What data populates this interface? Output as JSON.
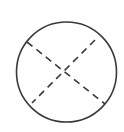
{
  "diagram": {
    "stroke_color": "#3a3a3a",
    "background": "#ffffff",
    "circle": {
      "cx": 66.5,
      "cy": 72,
      "r": 50
    },
    "dashed_lines": [
      {
        "x1": 27,
        "y1": 42,
        "x2": 105,
        "y2": 104
      },
      {
        "x1": 95,
        "y1": 40,
        "x2": 32,
        "y2": 103
      }
    ]
  }
}
